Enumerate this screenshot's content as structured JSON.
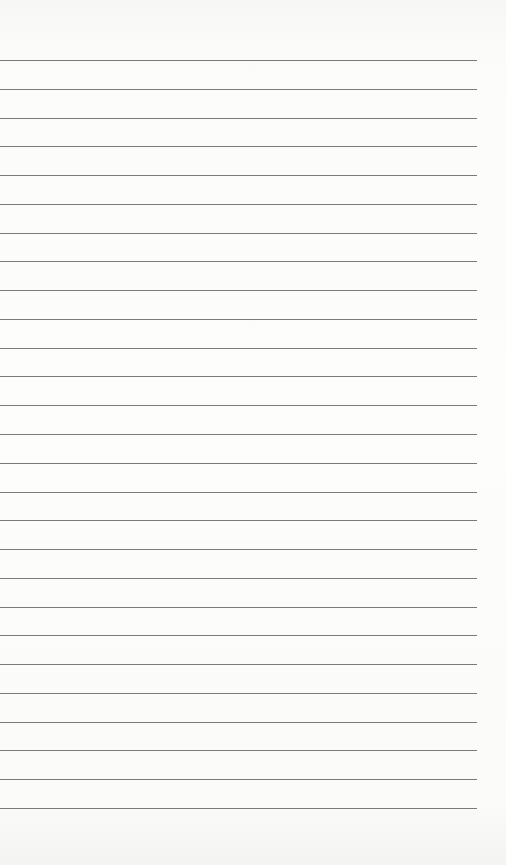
{
  "page": {
    "type": "lined-paper",
    "background": "#fdfdfc",
    "line_color": "#7a7a7a",
    "line_count": 27,
    "first_line_y": 60,
    "line_spacing": 28.77,
    "line_left": 0,
    "line_width": 477
  }
}
